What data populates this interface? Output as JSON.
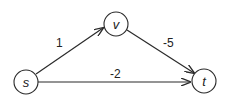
{
  "diagram": {
    "type": "directed-weighted-graph",
    "nodes": [
      {
        "id": "s",
        "label": "s",
        "cx": 26,
        "cy": 82
      },
      {
        "id": "v",
        "label": "v",
        "cx": 116,
        "cy": 24
      },
      {
        "id": "t",
        "label": "t",
        "cx": 204,
        "cy": 81
      }
    ],
    "edges": [
      {
        "from": "s",
        "to": "v",
        "weight": "1"
      },
      {
        "from": "v",
        "to": "t",
        "weight": "-5"
      },
      {
        "from": "s",
        "to": "t",
        "weight": "-2"
      }
    ],
    "colors": {
      "stroke": "#2a2a2a",
      "text": "#222222",
      "background": "#ffffff"
    }
  }
}
